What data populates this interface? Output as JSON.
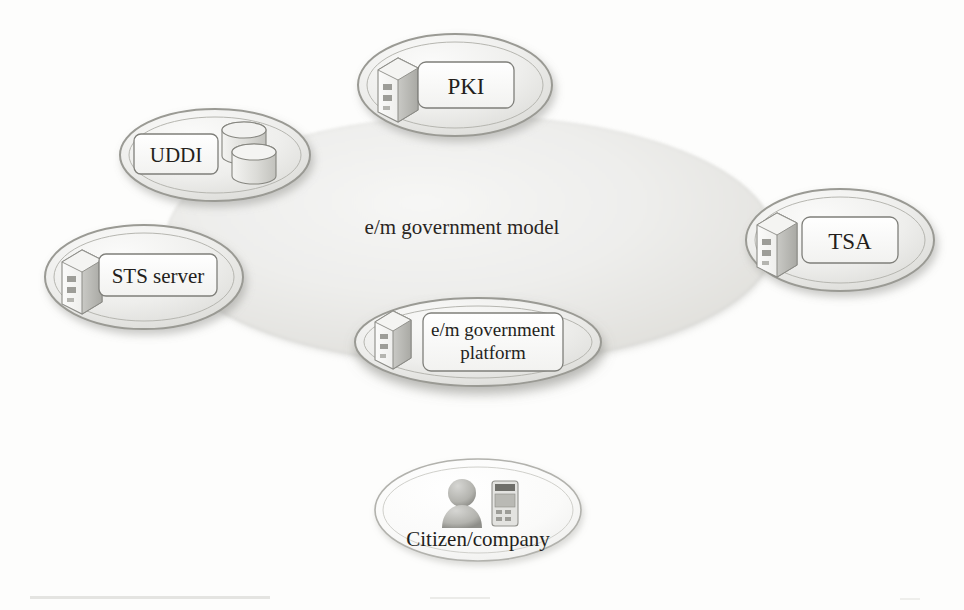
{
  "diagram": {
    "title": "e/m government model",
    "type": "conceptual-architecture-diagram",
    "cloud": {
      "name": "e-m-government-model-cloud",
      "label": "e/m government model",
      "shape": "ellipse",
      "cx": 470,
      "cy": 240,
      "rx": 305,
      "ry": 125,
      "fill": "#e8e8e6",
      "edge_style": "soft-grainy-dotted",
      "label_x": 462,
      "label_y": 227,
      "label_font_size": 21
    },
    "nodes": [
      {
        "id": "pki",
        "name": "pki-node",
        "label": "PKI",
        "icon": "server-icon",
        "shape": "ellipse",
        "cx": 455,
        "cy": 85,
        "rx": 97,
        "ry": 51,
        "label_box": {
          "x": 418,
          "y": 62,
          "w": 96,
          "h": 46
        },
        "label_font_size": 23,
        "icon_x": 378,
        "icon_y": 56
      },
      {
        "id": "uddi",
        "name": "uddi-node",
        "label": "UDDI",
        "icon": "database-cylinders-icon",
        "shape": "ellipse",
        "cx": 215,
        "cy": 155,
        "rx": 95,
        "ry": 46,
        "label_box": {
          "x": 134,
          "y": 133,
          "w": 82,
          "h": 42
        },
        "label_font_size": 21,
        "icon_x": 222,
        "icon_y": 119
      },
      {
        "id": "sts-server",
        "name": "sts-server-node",
        "label": "STS server",
        "icon": "server-icon",
        "shape": "ellipse",
        "cx": 144,
        "cy": 277,
        "rx": 99,
        "ry": 52,
        "label_box": {
          "x": 100,
          "y": 252,
          "w": 116,
          "h": 44
        },
        "label_font_size": 21,
        "icon_x": 62,
        "icon_y": 246
      },
      {
        "id": "tsa",
        "name": "tsa-node",
        "label": "TSA",
        "icon": "server-icon",
        "shape": "ellipse",
        "cx": 840,
        "cy": 240,
        "rx": 94,
        "ry": 51,
        "label_box": {
          "x": 802,
          "y": 216,
          "w": 96,
          "h": 46
        },
        "label_font_size": 23,
        "icon_x": 757,
        "icon_y": 211
      },
      {
        "id": "em-government-platform",
        "name": "em-government-platform-node",
        "label": "e/m government\nplatform",
        "icon": "server-icon",
        "shape": "ellipse",
        "cx": 478,
        "cy": 342,
        "rx": 123,
        "ry": 44,
        "label_box": {
          "x": 424,
          "y": 312,
          "w": 139,
          "h": 58
        },
        "label_font_size": 19,
        "icon_x": 375,
        "icon_y": 312
      },
      {
        "id": "citizen-company",
        "name": "citizen-company-node",
        "label": "Citizen/company",
        "icon": "person-and-mobile-device-icon",
        "shape": "ellipse",
        "cx": 478,
        "cy": 510,
        "rx": 103,
        "ry": 51,
        "label_x": 478,
        "label_y": 541,
        "label_font_size": 21,
        "person_icon_x": 440,
        "person_icon_y": 481,
        "device_icon_x": 489,
        "device_icon_y": 481
      }
    ],
    "colors": {
      "cloud_fill": "#e9e9e7",
      "cloud_edge": "#b9b9b4",
      "node_fill": "#f2f2f0",
      "node_stroke": "#9a9a94",
      "label_box_fill": "#fcfcfb",
      "label_box_stroke": "#8d8d87",
      "text": "#241f1c",
      "icon_light": "#f0f0ee",
      "icon_mid": "#c9c9c5",
      "icon_dark": "#8f8f8a",
      "background": "#fdfdfc"
    }
  }
}
